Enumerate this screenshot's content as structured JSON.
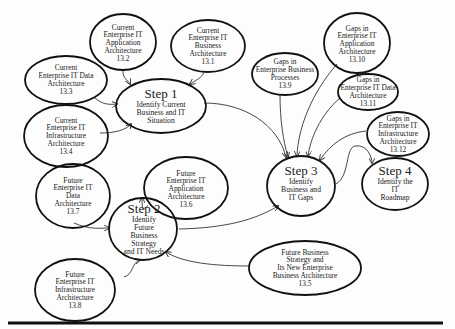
{
  "diagram": {
    "type": "process-flow",
    "steps": [
      {
        "id": "step1",
        "title": "Step 1",
        "lines": [
          "Identify Current",
          "Business and IT",
          "Situation"
        ]
      },
      {
        "id": "step2",
        "title": "Step 2",
        "lines": [
          "Identify",
          "Future",
          "Business",
          "Strategy",
          "and IT Needs"
        ]
      },
      {
        "id": "step3",
        "title": "Step 3",
        "lines": [
          "Identify",
          "Business and",
          "IT Gaps"
        ]
      },
      {
        "id": "step4",
        "title": "Step 4",
        "lines": [
          "Identify the",
          "IT",
          "Roadmap"
        ]
      }
    ],
    "inputs": [
      {
        "id": "n13_2",
        "lines": [
          "Current",
          "Enterprise IT",
          "Application",
          "Architecture",
          "13.2"
        ]
      },
      {
        "id": "n13_1",
        "lines": [
          "Current",
          "Enterprise IT",
          "Business",
          "Architecture",
          "13.1"
        ]
      },
      {
        "id": "n13_3",
        "lines": [
          "Current",
          "Enterprise IT Data",
          "Architecture",
          "13.3"
        ]
      },
      {
        "id": "n13_4",
        "lines": [
          "Current",
          "Enterprise IT",
          "Infrastructure",
          "Architecture",
          "13.4"
        ]
      },
      {
        "id": "n13_9",
        "lines": [
          "Gaps in",
          "Enterprise Business",
          "Processes",
          "13.9"
        ]
      },
      {
        "id": "n13_10",
        "lines": [
          "Gaps in",
          "Enterprise IT",
          "Application",
          "Architecture",
          "13.10"
        ]
      },
      {
        "id": "n13_11",
        "lines": [
          "Gaps in",
          "Enterprise IT Data",
          "Architecture",
          "13.11"
        ]
      },
      {
        "id": "n13_12",
        "lines": [
          "Gaps in",
          "Enterprise IT",
          "Infrastructure",
          "Architecture",
          "13.12"
        ]
      },
      {
        "id": "n13_6",
        "lines": [
          "Future",
          "Enterprise IT",
          "Application",
          "Architecture",
          "13.6"
        ]
      },
      {
        "id": "n13_7",
        "lines": [
          "Future",
          "Enterprise IT",
          "Data",
          "Architecture",
          "13.7"
        ]
      },
      {
        "id": "n13_8",
        "lines": [
          "Future",
          "Enterprise IT",
          "Infrastructure",
          "Architecture",
          "13.8"
        ]
      },
      {
        "id": "n13_5",
        "lines": [
          "Future Business",
          "Strategy and",
          "Its New Enterprise",
          "Business Architecture",
          "13.5"
        ]
      }
    ],
    "edges": [
      {
        "from": "n13_2",
        "to": "step1"
      },
      {
        "from": "n13_1",
        "to": "step1"
      },
      {
        "from": "n13_3",
        "to": "step1"
      },
      {
        "from": "n13_4",
        "to": "step1"
      },
      {
        "from": "step1",
        "to": "step3"
      },
      {
        "from": "n13_6",
        "to": "step2"
      },
      {
        "from": "n13_7",
        "to": "step2"
      },
      {
        "from": "n13_8",
        "to": "step2"
      },
      {
        "from": "n13_5",
        "to": "step2"
      },
      {
        "from": "step2",
        "to": "step3"
      },
      {
        "from": "n13_9",
        "to": "step3"
      },
      {
        "from": "n13_10",
        "to": "step3"
      },
      {
        "from": "n13_11",
        "to": "step3"
      },
      {
        "from": "n13_12",
        "to": "step3"
      },
      {
        "from": "step3",
        "to": "step4"
      }
    ],
    "colors": {
      "stroke": "#111111",
      "text": "#222222",
      "background": "#fdfdfd"
    }
  }
}
